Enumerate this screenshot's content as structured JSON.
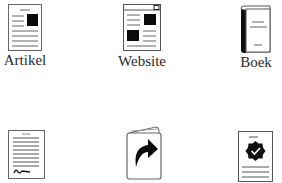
{
  "grid": {
    "items": [
      {
        "id": "artikel",
        "label": "Artikel",
        "icon": "article-icon"
      },
      {
        "id": "website",
        "label": "Website",
        "icon": "webpage-icon"
      },
      {
        "id": "boek",
        "label": "Boek",
        "icon": "book-icon"
      },
      {
        "id": "document",
        "label": "",
        "icon": "signed-document-icon"
      },
      {
        "id": "card",
        "label": "",
        "icon": "folded-card-share-icon"
      },
      {
        "id": "certificate",
        "label": "",
        "icon": "certificate-badge-icon"
      }
    ]
  },
  "colors": {
    "stroke": "#555555",
    "fill_dark": "#0a0a0a",
    "background": "#ffffff"
  }
}
